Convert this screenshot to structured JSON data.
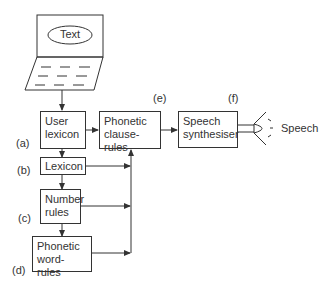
{
  "diagram": {
    "input": {
      "oval_label": "Text"
    },
    "nodes": [
      {
        "id": "a",
        "tag": "(a)",
        "label_line1": "User",
        "label_line2": "lexicon"
      },
      {
        "id": "b",
        "tag": "(b)",
        "label_line1": "Lexicon"
      },
      {
        "id": "c",
        "tag": "(c)",
        "label_line1": "Number",
        "label_line2": "rules"
      },
      {
        "id": "d",
        "tag": "(d)",
        "label_line1": "Phonetic",
        "label_line2": "word-rules"
      },
      {
        "id": "e",
        "tag": "(e)",
        "label_line1": "Phonetic",
        "label_line2": "clause-rules"
      },
      {
        "id": "f",
        "tag": "(f)",
        "label_line1": "Speech",
        "label_line2": "synthesiser"
      }
    ],
    "output": {
      "label": "Speech"
    },
    "edges": [
      [
        "input",
        "a"
      ],
      [
        "a",
        "b"
      ],
      [
        "b",
        "c"
      ],
      [
        "c",
        "d"
      ],
      [
        "a",
        "e"
      ],
      [
        "b",
        "e"
      ],
      [
        "c",
        "e"
      ],
      [
        "d",
        "e"
      ],
      [
        "e",
        "f"
      ],
      [
        "f",
        "output"
      ]
    ]
  }
}
